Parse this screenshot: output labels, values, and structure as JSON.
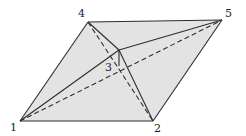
{
  "diagram": {
    "type": "polyhedron-triangulation",
    "colors": {
      "fill": "#e3e3e3",
      "stroke": "#2e2e2e",
      "background": "#ffffff"
    },
    "vertices": [
      {
        "id": "1",
        "label": "1",
        "x": 20,
        "y": 121,
        "lx": 10,
        "ly": 131
      },
      {
        "id": "2",
        "label": "2",
        "x": 153,
        "y": 121,
        "lx": 154,
        "ly": 132
      },
      {
        "id": "3",
        "label": "3",
        "x": 119,
        "y": 66,
        "lx": 105,
        "ly": 71
      },
      {
        "id": "4",
        "label": "4",
        "x": 88,
        "y": 22,
        "lx": 78,
        "ly": 17
      },
      {
        "id": "5",
        "label": "5",
        "x": 222,
        "y": 20,
        "lx": 225,
        "ly": 17
      }
    ],
    "apex": {
      "x": 119,
      "y": 50
    },
    "solid_edges": [
      [
        "1",
        "2"
      ],
      [
        "2",
        "5"
      ],
      [
        "5",
        "4"
      ],
      [
        "4",
        "1"
      ],
      [
        "1",
        "apex"
      ],
      [
        "4",
        "apex"
      ],
      [
        "apex",
        "2"
      ],
      [
        "apex",
        "5"
      ],
      [
        "apex",
        "3"
      ]
    ],
    "dashed_edges": [
      [
        "1",
        "5"
      ],
      [
        "4",
        "2"
      ]
    ]
  }
}
